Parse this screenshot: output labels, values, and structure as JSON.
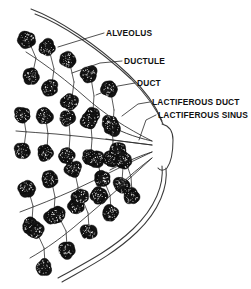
{
  "figure": {
    "background_color": "#ffffff",
    "ink_color": "#1a1a1a",
    "width": 251,
    "height": 289
  },
  "labels": [
    {
      "id": "alveolus",
      "text": "ALVEOLUS",
      "x": 106,
      "y": 36,
      "leader": "M104,33 L84,39 L58,47"
    },
    {
      "id": "ductule",
      "text": "DUCTULE",
      "x": 124,
      "y": 64,
      "leader": "M122,61 L100,63 L72,73"
    },
    {
      "id": "duct",
      "text": "DUCT",
      "x": 137,
      "y": 86,
      "leader": "M135,83 L118,86 L96,95"
    },
    {
      "id": "lactiferous-duct",
      "text": "LACTIFEROUS DUCT",
      "x": 152,
      "y": 105,
      "leader": "M150,102 L138,104 L122,116"
    },
    {
      "id": "lactiferous-sinus",
      "text": "LACTIFEROUS SINUS",
      "x": 158,
      "y": 118,
      "leader": "M156,115 L146,120 L139,140"
    }
  ],
  "outline": {
    "skin_upper_outer": "M31,9 C58,19 96,44 128,74 C146,91 156,106 162,121",
    "skin_upper_inner": "M35,14 C62,24 99,49 131,79 C147,95 157,110 163,124",
    "skin_lower_outer": "M166,168 C168,186 160,210 137,232 C113,255 86,268 62,282",
    "skin_lower_inner": "M162,166 C164,184 156,207 133,229 C110,251 83,264 58,278",
    "nipple": "M162,124 C170,126 173,131 173,140 C173,152 172,161 167,168 C164,171 160,171 158,168"
  },
  "nipple_junction": {
    "x": 160,
    "y": 146
  },
  "lobes": [
    {
      "id": "lobe-1",
      "axis_start": {
        "x": 24,
        "y": 48
      },
      "axis_end": {
        "x": 152,
        "y": 140
      },
      "main_duct": "M152,141 C126,128 104,114 84,96 C68,82 48,66 26,52",
      "sinus": "M152,141 C134,137 118,131 106,123",
      "branches": [
        {
          "stem": "M36,58 L30,44",
          "alveoli": [
            {
              "x": 27,
              "y": 40,
              "r": 8
            }
          ]
        },
        {
          "stem": "M36,58 L33,72",
          "alveoli": [
            {
              "x": 31,
              "y": 76,
              "r": 8
            }
          ]
        },
        {
          "stem": "M54,69 L50,53",
          "alveoli": [
            {
              "x": 47,
              "y": 48,
              "r": 8
            }
          ]
        },
        {
          "stem": "M54,69 L52,84",
          "alveoli": [
            {
              "x": 50,
              "y": 88,
              "r": 8
            }
          ]
        },
        {
          "stem": "M74,82 L70,64",
          "alveoli": [
            {
              "x": 68,
              "y": 60,
              "r": 8
            }
          ]
        },
        {
          "stem": "M74,82 L72,98",
          "alveoli": [
            {
              "x": 70,
              "y": 102,
              "r": 8
            }
          ]
        },
        {
          "stem": "M94,96 L91,78",
          "alveoli": [
            {
              "x": 89,
              "y": 74,
              "r": 8
            }
          ]
        },
        {
          "stem": "M94,96 L93,111",
          "alveoli": [
            {
              "x": 92,
              "y": 115,
              "r": 8
            }
          ]
        },
        {
          "stem": "M114,110 L111,93",
          "alveoli": [
            {
              "x": 109,
              "y": 89,
              "r": 8
            }
          ]
        },
        {
          "stem": "M114,110 L113,124",
          "alveoli": [
            {
              "x": 112,
              "y": 128,
              "r": 8
            }
          ]
        }
      ]
    },
    {
      "id": "lobe-2",
      "axis_start": {
        "x": 16,
        "y": 130
      },
      "axis_end": {
        "x": 152,
        "y": 146
      },
      "main_duct": "M152,145 C120,141 88,137 56,134 C42,133 28,132 16,131",
      "sinus": "M152,145 C136,143 120,141 106,139",
      "branches": [
        {
          "stem": "M26,132 L24,119",
          "alveoli": [
            {
              "x": 22,
              "y": 115,
              "r": 8
            }
          ]
        },
        {
          "stem": "M26,132 L24,147",
          "alveoli": [
            {
              "x": 22,
              "y": 151,
              "r": 8
            }
          ]
        },
        {
          "stem": "M48,134 L46,120",
          "alveoli": [
            {
              "x": 44,
              "y": 116,
              "r": 8
            }
          ]
        },
        {
          "stem": "M48,134 L47,149",
          "alveoli": [
            {
              "x": 45,
              "y": 153,
              "r": 8
            }
          ]
        },
        {
          "stem": "M70,136 L69,122",
          "alveoli": [
            {
              "x": 67,
              "y": 118,
              "r": 8
            }
          ]
        },
        {
          "stem": "M70,136 L69,151",
          "alveoli": [
            {
              "x": 67,
              "y": 155,
              "r": 8
            }
          ]
        },
        {
          "stem": "M92,139 L91,125",
          "alveoli": [
            {
              "x": 89,
              "y": 121,
              "r": 8
            }
          ]
        },
        {
          "stem": "M92,139 L91,153",
          "alveoli": [
            {
              "x": 90,
              "y": 157,
              "r": 8
            }
          ]
        },
        {
          "stem": "M113,141 L112,127",
          "alveoli": [
            {
              "x": 110,
              "y": 123,
              "r": 8
            }
          ]
        },
        {
          "stem": "M113,141 L112,155",
          "alveoli": [
            {
              "x": 111,
              "y": 159,
              "r": 8
            }
          ]
        }
      ]
    },
    {
      "id": "lobe-3",
      "axis_start": {
        "x": 20,
        "y": 212
      },
      "axis_end": {
        "x": 152,
        "y": 152
      },
      "main_duct": "M152,152 C126,164 100,178 74,190 C56,198 36,206 20,212",
      "sinus": "M152,152 C136,157 122,164 110,170",
      "branches": [
        {
          "stem": "M33,206 L29,192",
          "alveoli": [
            {
              "x": 27,
              "y": 188,
              "r": 8
            }
          ]
        },
        {
          "stem": "M33,206 L32,221",
          "alveoli": [
            {
              "x": 30,
              "y": 225,
              "r": 8
            }
          ]
        },
        {
          "stem": "M55,197 L52,183",
          "alveoli": [
            {
              "x": 50,
              "y": 179,
              "r": 8
            }
          ]
        },
        {
          "stem": "M55,197 L54,212",
          "alveoli": [
            {
              "x": 53,
              "y": 216,
              "r": 8
            }
          ]
        },
        {
          "stem": "M78,187 L75,173",
          "alveoli": [
            {
              "x": 73,
              "y": 169,
              "r": 8
            }
          ]
        },
        {
          "stem": "M78,187 L77,202",
          "alveoli": [
            {
              "x": 76,
              "y": 206,
              "r": 8
            }
          ]
        },
        {
          "stem": "M101,177 L98,163",
          "alveoli": [
            {
              "x": 96,
              "y": 159,
              "r": 8
            }
          ]
        },
        {
          "stem": "M101,177 L100,192",
          "alveoli": [
            {
              "x": 99,
              "y": 196,
              "r": 8
            }
          ]
        },
        {
          "stem": "M123,167 L120,154",
          "alveoli": [
            {
              "x": 118,
              "y": 150,
              "r": 8
            }
          ]
        },
        {
          "stem": "M123,167 L122,181",
          "alveoli": [
            {
              "x": 121,
              "y": 185,
              "r": 8
            }
          ]
        }
      ]
    },
    {
      "id": "lobe-4",
      "axis_start": {
        "x": 30,
        "y": 258
      },
      "axis_end": {
        "x": 152,
        "y": 158
      },
      "main_duct": "M152,158 C128,180 104,202 80,222 C64,236 46,249 30,258",
      "sinus": "M152,158 C140,167 128,177 118,187",
      "branches": [
        {
          "stem": "M44,248 L38,235",
          "alveoli": [
            {
              "x": 35,
              "y": 231,
              "r": 8
            }
          ]
        },
        {
          "stem": "M44,248 L45,263",
          "alveoli": [
            {
              "x": 44,
              "y": 267,
              "r": 8
            }
          ]
        },
        {
          "stem": "M66,231 L60,219",
          "alveoli": [
            {
              "x": 57,
              "y": 215,
              "r": 8
            }
          ]
        },
        {
          "stem": "M66,231 L67,246",
          "alveoli": [
            {
              "x": 66,
              "y": 250,
              "r": 8
            }
          ]
        },
        {
          "stem": "M88,213 L83,201",
          "alveoli": [
            {
              "x": 80,
              "y": 197,
              "r": 8
            }
          ]
        },
        {
          "stem": "M88,213 L89,228",
          "alveoli": [
            {
              "x": 88,
              "y": 232,
              "r": 8
            }
          ]
        },
        {
          "stem": "M110,195 L105,183",
          "alveoli": [
            {
              "x": 102,
              "y": 179,
              "r": 8
            }
          ]
        },
        {
          "stem": "M110,195 L111,210",
          "alveoli": [
            {
              "x": 110,
              "y": 214,
              "r": 8
            }
          ]
        },
        {
          "stem": "M131,177 L127,165",
          "alveoli": [
            {
              "x": 124,
              "y": 161,
              "r": 8
            }
          ]
        },
        {
          "stem": "M131,177 L132,192",
          "alveoli": [
            {
              "x": 131,
              "y": 196,
              "r": 8
            }
          ]
        }
      ]
    }
  ]
}
